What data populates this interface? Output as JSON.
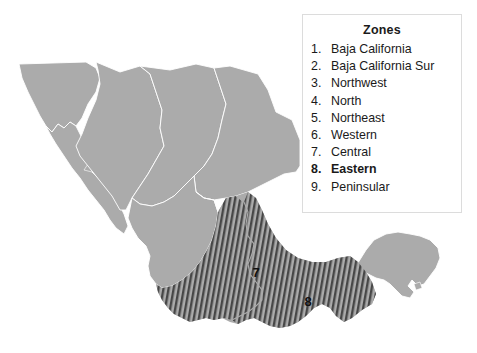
{
  "figure": {
    "kind": "map",
    "title_visible": false,
    "background_color": "#ffffff"
  },
  "map": {
    "name": "mexico-zones-map",
    "base_fill_color": "#ababab",
    "border_line_color": "#ffffff",
    "hatch_stripe_color": "#474747",
    "hatch_background_color": "#ababab",
    "labels": [
      {
        "text": "7",
        "zone": "Central",
        "x": 256,
        "y": 277
      },
      {
        "text": "8",
        "zone": "Eastern",
        "x": 308,
        "y": 306
      }
    ]
  },
  "legend": {
    "title": "Zones",
    "border_color": "#dcdcdc",
    "background_color": "#ffffff",
    "items": [
      {
        "number": "1.",
        "label": "Baja California",
        "bold": false
      },
      {
        "number": "2.",
        "label": "Baja California Sur",
        "bold": false
      },
      {
        "number": "3.",
        "label": "Northwest",
        "bold": false
      },
      {
        "number": "4.",
        "label": "North",
        "bold": false
      },
      {
        "number": "5.",
        "label": "Northeast",
        "bold": false
      },
      {
        "number": "6.",
        "label": "Western",
        "bold": false
      },
      {
        "number": "7.",
        "label": "Central",
        "bold": false
      },
      {
        "number": "8.",
        "label": "Eastern",
        "bold": true
      },
      {
        "number": "9.",
        "label": "Peninsular",
        "bold": false
      }
    ]
  }
}
